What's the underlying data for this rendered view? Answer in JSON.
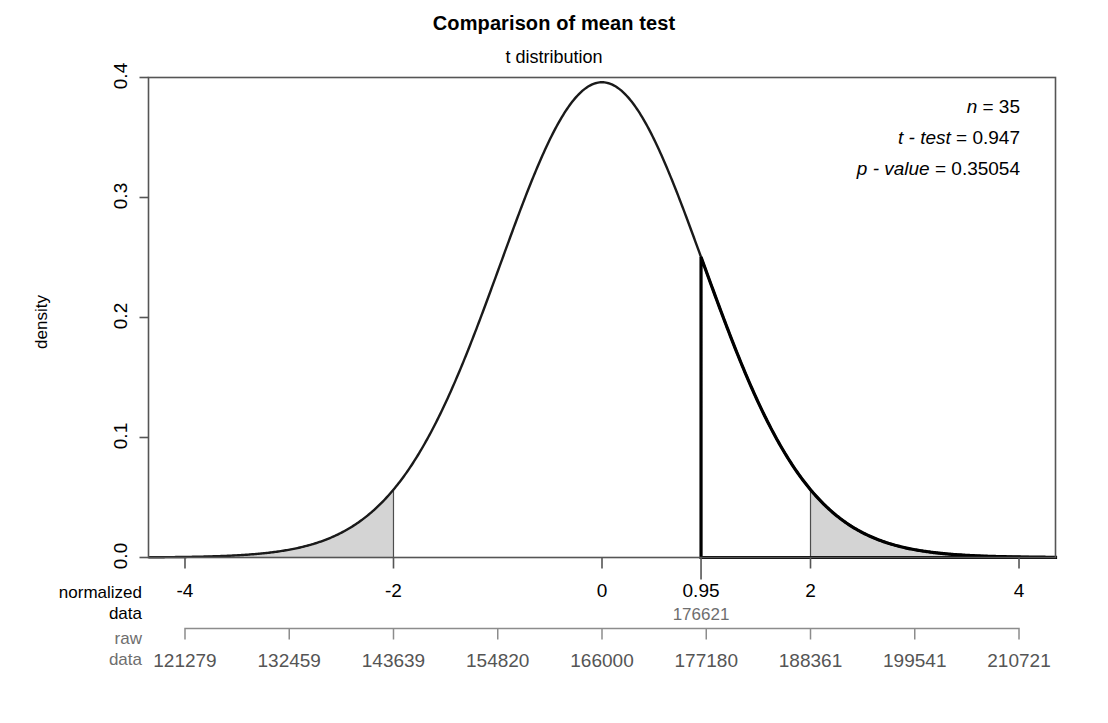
{
  "titles": {
    "main": "Comparison of mean test",
    "sub": "t distribution"
  },
  "axes": {
    "y_label": "density",
    "y_ticks": [
      "0.0",
      "0.1",
      "0.2",
      "0.3",
      "0.4"
    ],
    "y_tick_values": [
      0.0,
      0.1,
      0.2,
      0.3,
      0.4
    ],
    "x_label_normalized_line1": "normalized",
    "x_label_normalized_line2": "data",
    "x_label_raw_line1": "raw",
    "x_label_raw_line2": "data",
    "x_ticks": [
      "-4",
      "-2",
      "0",
      "2",
      "4"
    ],
    "x_tick_values": [
      -4,
      -2,
      0,
      2,
      4
    ],
    "raw_ticks": [
      "121279",
      "132459",
      "143639",
      "154820",
      "166000",
      "177180",
      "188361",
      "199541",
      "210721"
    ],
    "raw_tick_normalized_positions": [
      -4,
      -3,
      -2,
      -1,
      0,
      1,
      2,
      3,
      4
    ]
  },
  "statistic": {
    "tick_label": "0.95",
    "tick_value": 0.95,
    "raw_label": "176621"
  },
  "annotations": {
    "n_var": "n",
    "n_eq": " = ",
    "n_val": "35",
    "t_var": "t - test",
    "t_eq": " = ",
    "t_val": "0.947",
    "p_var": "p - value",
    "p_eq": " = ",
    "p_val": "0.35054"
  },
  "colors": {
    "curve": "#1a1a1a",
    "shade_fill": "#d4d4d4",
    "shade_border": "#4d4d4d",
    "axis": "#555555",
    "raw_axis": "#8c8c8c",
    "raw_text": "#555555",
    "background": "#ffffff"
  },
  "chart_data": {
    "type": "line",
    "title": "Comparison of mean test",
    "subtitle": "t distribution",
    "xlabel": "normalized data",
    "ylabel": "density",
    "xlim": [
      -4.35,
      4.35
    ],
    "ylim": [
      0.0,
      0.4
    ],
    "grid": false,
    "legend": null,
    "distribution": "student-t",
    "degrees_of_freedom": 34,
    "sample_size": 35,
    "t_statistic": 0.947,
    "p_value": 0.35054,
    "critical_values": [
      -2,
      2
    ],
    "shaded_regions": [
      {
        "name": "left-rejection-tail",
        "from": -4.35,
        "to": -2,
        "fill": "#d4d4d4"
      },
      {
        "name": "right-rejection-tail",
        "from": 2,
        "to": 4.35,
        "fill": "#d4d4d4"
      }
    ],
    "vertical_marker": {
      "x": 0.95,
      "label": "0.95",
      "raw_label": "176621"
    },
    "secondary_axis": {
      "name": "raw data",
      "ticks": [
        "121279",
        "132459",
        "143639",
        "154820",
        "166000",
        "177180",
        "188361",
        "199541",
        "210721"
      ],
      "values": [
        121279,
        132459,
        143639,
        154820,
        166000,
        177180,
        188361,
        199541,
        210721
      ],
      "mapped_normalized": [
        -4,
        -3,
        -2,
        -1,
        0,
        1,
        2,
        3,
        4
      ]
    },
    "series": [
      {
        "name": "t density (df=34)",
        "x": [
          -4.35,
          -4.0,
          -3.5,
          -3.0,
          -2.5,
          -2.0,
          -1.5,
          -1.0,
          -0.5,
          0.0,
          0.5,
          0.95,
          1.0,
          1.5,
          2.0,
          2.5,
          3.0,
          3.5,
          4.0,
          4.35
        ],
        "y": [
          0.0012,
          0.0022,
          0.0055,
          0.0128,
          0.0274,
          0.0534,
          0.0938,
          0.1464,
          0.2012,
          0.3947,
          0.2012,
          0.1465,
          0.1464,
          0.0938,
          0.0534,
          0.0274,
          0.0128,
          0.0055,
          0.0022,
          0.0012
        ]
      }
    ]
  }
}
